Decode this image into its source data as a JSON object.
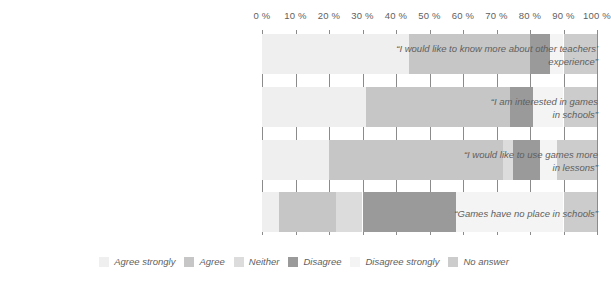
{
  "chart_data": {
    "type": "bar",
    "orientation": "horizontal",
    "stacked": true,
    "normalized_percent": true,
    "title": "",
    "subtitle": "",
    "xlabel": "",
    "ylabel": "",
    "xlim": [
      0,
      100
    ],
    "grid": true,
    "legend_position": "bottom",
    "xticks": [
      {
        "value": 0,
        "label": "0 %"
      },
      {
        "value": 10,
        "label": "10 %"
      },
      {
        "value": 20,
        "label": "20 %"
      },
      {
        "value": 30,
        "label": "30 %"
      },
      {
        "value": 40,
        "label": "40 %"
      },
      {
        "value": 50,
        "label": "50 %"
      },
      {
        "value": 60,
        "label": "60 %"
      },
      {
        "value": 70,
        "label": "70 %"
      },
      {
        "value": 80,
        "label": "80 %"
      },
      {
        "value": 90,
        "label": "90 %"
      },
      {
        "value": 100,
        "label": "100 %"
      }
    ],
    "categories": [
      "“I would like to know more about other teachers’ experience”",
      "“I am interested in games in schools”",
      "“I would like to use games more in lessons”",
      "“Games have no place in schools”"
    ],
    "category_lines": [
      [
        "“I would like to know more about other teachers’",
        "experience”"
      ],
      [
        "“I am interested in games",
        "in schools”"
      ],
      [
        "“I would like to use games more",
        "in lessons”"
      ],
      [
        "“Games have no place in schools”"
      ]
    ],
    "series": [
      {
        "name": "Agree strongly",
        "color": "#efefef",
        "values": [
          44,
          31,
          20,
          5
        ]
      },
      {
        "name": "Agree",
        "color": "#c6c6c6",
        "values": [
          36,
          43,
          52,
          17
        ]
      },
      {
        "name": "Neither",
        "color": "#dcdcdc",
        "values": [
          0,
          0,
          3,
          8
        ]
      },
      {
        "name": "Disagree",
        "color": "#9a9a9a",
        "values": [
          6,
          7,
          8,
          28
        ]
      },
      {
        "name": "Disagree strongly",
        "color": "#f4f4f4",
        "values": [
          4,
          9,
          5,
          32
        ]
      },
      {
        "name": "No answer",
        "color": "#cccccc",
        "values": [
          10,
          10,
          12,
          10
        ]
      }
    ]
  },
  "legend": {
    "items": [
      {
        "label": "Agree strongly",
        "color": "#efefef"
      },
      {
        "label": "Agree",
        "color": "#c6c6c6"
      },
      {
        "label": "Neither",
        "color": "#dcdcdc"
      },
      {
        "label": "Disagree",
        "color": "#9a9a9a"
      },
      {
        "label": "Disagree strongly",
        "color": "#f4f4f4"
      },
      {
        "label": "No answer",
        "color": "#cccccc"
      }
    ]
  },
  "style": {
    "grid_color": "#8b8b8b",
    "text_color": "#5f5f5f",
    "background": "#ffffff"
  }
}
